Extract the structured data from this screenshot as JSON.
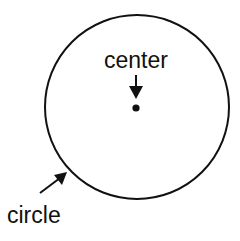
{
  "diagram": {
    "labels": {
      "center": "center",
      "circle": "circle"
    },
    "colors": {
      "stroke": "#111111",
      "background": "#ffffff"
    },
    "circle": {
      "cx": 137,
      "cy": 107,
      "r": 92
    }
  }
}
